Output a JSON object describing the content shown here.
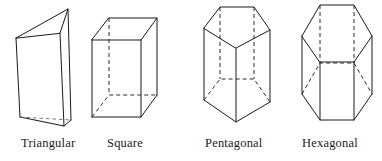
{
  "figure": {
    "kind": "geometry-diagram",
    "background_color": "#ffffff",
    "line_color": "#1a1a1a",
    "hidden_line_style": "dashed",
    "prisms": [
      {
        "id": "triangular",
        "label": "Triangular",
        "base_sides": 3,
        "base_shape": "triangle",
        "orientation": "vertical",
        "visible_faces": 2,
        "hidden_edges": 1
      },
      {
        "id": "square",
        "label": "Square",
        "base_sides": 4,
        "base_shape": "square",
        "orientation": "vertical",
        "visible_faces": 2,
        "hidden_edges": 3
      },
      {
        "id": "pentagonal",
        "label": "Pentagonal",
        "base_sides": 5,
        "base_shape": "pentagon",
        "orientation": "vertical",
        "visible_faces": 3,
        "hidden_edges": 4
      },
      {
        "id": "hexagonal",
        "label": "Hexagonal",
        "base_sides": 6,
        "base_shape": "hexagon",
        "orientation": "vertical",
        "visible_faces": 3,
        "hidden_edges": 4
      }
    ]
  }
}
